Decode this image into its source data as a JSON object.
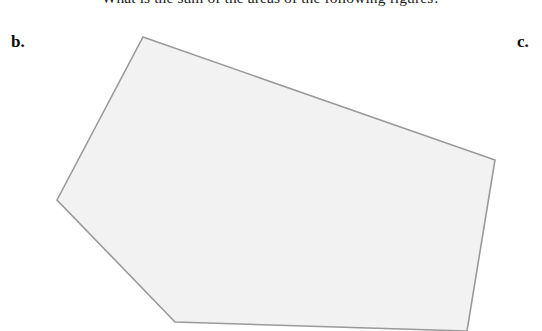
{
  "page": {
    "width": 542,
    "height": 331,
    "background_color": "#ffffff"
  },
  "question": {
    "text": "What is the sum of the areas of the following figures?",
    "clipped": "true"
  },
  "parts": {
    "previous_label": "b.",
    "next_label": "c."
  },
  "figure": {
    "name": "irregular-pentagon",
    "shape_type": "polygon",
    "vertex_count": 5,
    "fill_color": "#f2f2f2",
    "stroke_color": "#9a9a9a",
    "stroke_width": 1.6,
    "points": "143,37 495,160 467,331 175,322 57,200",
    "vertices": [
      {
        "name": "top",
        "x": 143,
        "y": 37
      },
      {
        "name": "right",
        "x": 495,
        "y": 160
      },
      {
        "name": "bottom-right",
        "x": 467,
        "y": 331
      },
      {
        "name": "bottom-left",
        "x": 175,
        "y": 322
      },
      {
        "name": "left",
        "x": 57,
        "y": 200
      }
    ]
  }
}
